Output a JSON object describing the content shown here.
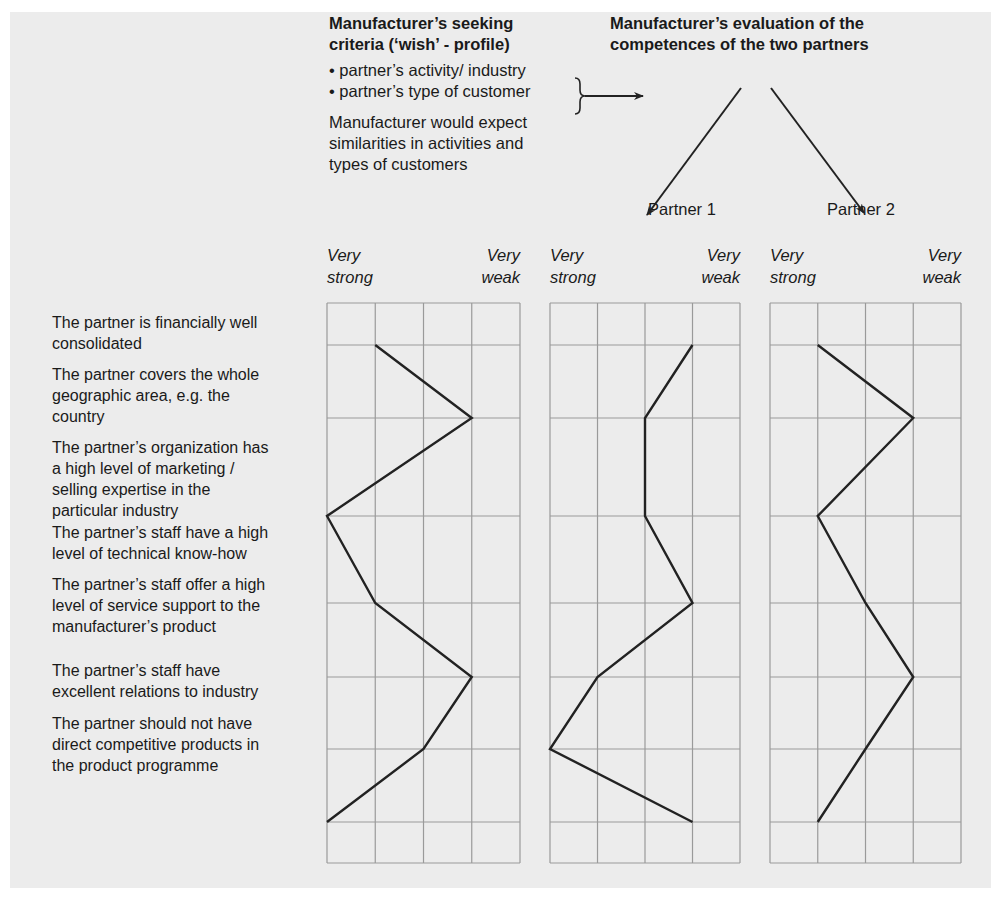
{
  "header": {
    "wish_title_line1": "Manufacturer’s seeking",
    "wish_title_line2": "criteria (‘wish’ - profile)",
    "wish_bullets": [
      "• partner’s activity/ industry",
      "• partner’s type of customer"
    ],
    "wish_note_lines": [
      "Manufacturer would expect",
      "similarities in activities and",
      "types of customers"
    ],
    "eval_title_line1": "Manufacturer’s evaluation of the",
    "eval_title_line2": "competences of the two partners",
    "partner1_label": "Partner 1",
    "partner2_label": "Partner 2"
  },
  "scale": {
    "left_line1": "Very",
    "left_line2": "strong",
    "right_line1": "Very",
    "right_line2": "weak"
  },
  "criteria": [
    {
      "lines": [
        "The partner is financially well",
        "consolidated"
      ]
    },
    {
      "lines": [
        "The partner covers the whole",
        "geographic area, e.g. the",
        "country"
      ]
    },
    {
      "lines": [
        "The partner’s organization has",
        "a high level of marketing /",
        "selling expertise in the",
        "particular industry"
      ]
    },
    {
      "lines": [
        "The partner’s staff have a high",
        "level of technical know-how"
      ]
    },
    {
      "lines": [
        "The partner’s staff offer a high",
        "level of service support to the",
        "manufacturer’s product"
      ]
    },
    {
      "lines": [
        "The partner’s staff have",
        "excellent relations to industry"
      ]
    },
    {
      "lines": [
        "The partner should not have",
        "direct competitive products in",
        "the product programme"
      ]
    }
  ],
  "chart_data": {
    "type": "line",
    "xlabel": "Scale from Very strong (1) to Very weak (5)",
    "scale_range": [
      1,
      5
    ],
    "categories": [
      "The partner is financially well consolidated",
      "The partner covers the whole geographic area, e.g. the country",
      "The partner's organization has a high level of marketing / selling expertise in the particular industry",
      "The partner's staff have a high level of technical know-how",
      "The partner's staff offer a high level of service support to the manufacturer's product",
      "The partner's staff have excellent relations to industry",
      "The partner should not have direct competitive products in the product programme"
    ],
    "series": [
      {
        "name": "Manufacturer's seeking criteria ('wish' - profile)",
        "values": [
          2,
          4,
          1,
          2,
          4,
          3,
          1
        ]
      },
      {
        "name": "Partner 1",
        "values": [
          4,
          3,
          3,
          4,
          2,
          1,
          4
        ]
      },
      {
        "name": "Partner 2",
        "values": [
          2,
          4,
          2,
          3,
          4,
          3,
          2
        ]
      }
    ],
    "grid": true
  },
  "colors": {
    "panel_bg": "#ececec",
    "grid_line": "#9a9a9a",
    "profile_line": "#222222"
  }
}
